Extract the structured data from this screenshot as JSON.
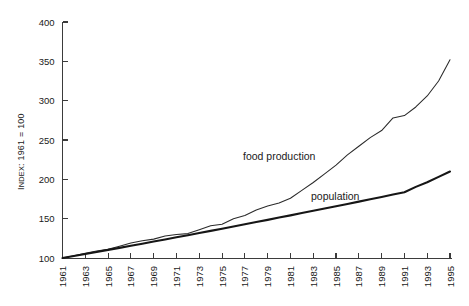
{
  "chart_data": {
    "type": "line",
    "title": "",
    "xlabel": "",
    "ylabel": "INDEX: 1961 = 100",
    "ylabel_parts": {
      "small_caps": "I",
      "rest_caps": "NDEX",
      "tail": ": 1961 = 100"
    },
    "xlim": [
      1961,
      1995
    ],
    "ylim": [
      100,
      400
    ],
    "yticks": [
      100,
      150,
      200,
      250,
      300,
      350,
      400
    ],
    "ytick_labels": [
      "100",
      "150",
      "200",
      "250",
      "300",
      "350",
      "400"
    ],
    "xticks": [
      1961,
      1963,
      1965,
      1967,
      1969,
      1971,
      1973,
      1975,
      1977,
      1979,
      1981,
      1983,
      1985,
      1987,
      1989,
      1991,
      1993,
      1995
    ],
    "xtick_labels": [
      "1961",
      "1963",
      "1965",
      "1967",
      "1969",
      "1971",
      "1973",
      "1975",
      "1977",
      "1979",
      "1981",
      "1983",
      "1985",
      "1987",
      "1989",
      "1991",
      "1993",
      "1995"
    ],
    "xtick_minor_every": 2,
    "grid": false,
    "legend_position": "inline-annotation",
    "x": [
      1961,
      1962,
      1963,
      1964,
      1965,
      1966,
      1967,
      1968,
      1969,
      1970,
      1971,
      1972,
      1973,
      1974,
      1975,
      1976,
      1977,
      1978,
      1979,
      1980,
      1981,
      1982,
      1983,
      1984,
      1985,
      1986,
      1987,
      1988,
      1989,
      1990,
      1991,
      1992,
      1993,
      1994,
      1995
    ],
    "series": [
      {
        "name": "food production",
        "label": "food production",
        "color": "#2a2a2a",
        "line_width": 1.05,
        "values": [
          100,
          103,
          106,
          109,
          111,
          115,
          119,
          122,
          124,
          128,
          130,
          131,
          136,
          141,
          143,
          150,
          154,
          161,
          166,
          170,
          176,
          186,
          196,
          207,
          218,
          231,
          242,
          253,
          262,
          278,
          281,
          292,
          306,
          325,
          352
        ]
      },
      {
        "name": "population",
        "label": "population",
        "color": "#161616",
        "line_width": 2.1,
        "values": [
          100,
          102.5,
          105.1,
          107.7,
          110.3,
          112.9,
          115.6,
          118.2,
          120.9,
          123.6,
          126.3,
          129.0,
          131.8,
          134.5,
          137.3,
          140.1,
          142.9,
          145.7,
          148.5,
          151.4,
          154.2,
          157.1,
          160.0,
          162.9,
          165.8,
          168.7,
          171.7,
          174.6,
          177.6,
          180.6,
          183.6,
          190.4,
          196.2,
          203.1,
          210.0
        ]
      }
    ],
    "annotations": [
      {
        "text": "food production",
        "x_px": 243,
        "y_px": 160
      },
      {
        "text": "population",
        "x_px": 311,
        "y_px": 200
      }
    ]
  }
}
